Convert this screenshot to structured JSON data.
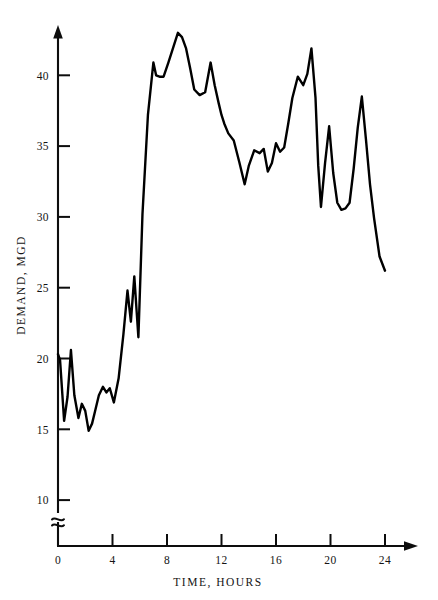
{
  "chart_data": {
    "type": "line",
    "title": "",
    "subtitle": "",
    "xlabel": "TIME, HOURS",
    "ylabel": "DEMAND, MGD",
    "xlim": [
      0,
      24
    ],
    "ylim": [
      10,
      44
    ],
    "y_axis_break": true,
    "y_axis_break_note": "axis broken between 0 and 10",
    "grid": false,
    "legend": null,
    "xticks": [
      0,
      4,
      8,
      12,
      16,
      20,
      24
    ],
    "xtick_labels": [
      "0",
      "4",
      "8",
      "12",
      "16",
      "20",
      "24"
    ],
    "yticks": [
      10,
      15,
      20,
      25,
      30,
      35,
      40
    ],
    "ytick_labels": [
      "10",
      "15",
      "20",
      "25",
      "30",
      "35",
      "40"
    ],
    "series": [
      {
        "name": "Hourly water demand",
        "x": [
          0.0,
          0.15,
          0.45,
          0.7,
          0.95,
          1.2,
          1.5,
          1.75,
          2.0,
          2.25,
          2.5,
          2.75,
          3.0,
          3.3,
          3.55,
          3.8,
          4.1,
          4.45,
          4.8,
          5.1,
          5.35,
          5.6,
          5.9,
          6.2,
          6.6,
          7.0,
          7.2,
          7.45,
          7.75,
          8.1,
          8.5,
          8.8,
          9.1,
          9.4,
          9.7,
          10.0,
          10.4,
          10.8,
          11.2,
          11.5,
          11.8,
          12.0,
          12.2,
          12.5,
          12.9,
          13.3,
          13.7,
          14.0,
          14.4,
          14.8,
          15.1,
          15.4,
          15.7,
          16.0,
          16.3,
          16.6,
          16.9,
          17.2,
          17.6,
          18.0,
          18.3,
          18.6,
          18.9,
          19.1,
          19.3,
          19.6,
          19.9,
          20.2,
          20.5,
          20.8,
          21.1,
          21.4,
          21.7,
          22.0,
          22.3,
          22.6,
          22.9,
          23.2,
          23.6,
          24.0
        ],
        "y": [
          20.3,
          19.9,
          15.6,
          17.3,
          20.6,
          17.4,
          15.8,
          16.8,
          16.3,
          14.9,
          15.4,
          16.4,
          17.4,
          18.0,
          17.6,
          17.9,
          16.9,
          18.6,
          21.7,
          24.8,
          22.6,
          25.8,
          21.5,
          30.2,
          37.2,
          40.9,
          40.0,
          39.9,
          39.9,
          40.9,
          42.1,
          43.0,
          42.7,
          41.9,
          40.5,
          39.0,
          38.6,
          38.8,
          40.9,
          39.3,
          38.0,
          37.2,
          36.6,
          35.9,
          35.4,
          33.9,
          32.3,
          33.6,
          34.7,
          34.5,
          34.8,
          33.2,
          33.8,
          35.2,
          34.6,
          34.9,
          36.6,
          38.4,
          39.9,
          39.3,
          40.1,
          41.9,
          38.4,
          33.6,
          30.7,
          33.8,
          36.4,
          33.1,
          31.0,
          30.5,
          30.6,
          31.0,
          33.4,
          36.3,
          38.5,
          35.5,
          32.3,
          29.9,
          27.2,
          26.2
        ]
      }
    ],
    "annotations": []
  },
  "axes": {
    "x_axis_name": "time-axis",
    "y_axis_name": "demand-axis",
    "x_arrow": true,
    "y_arrow": true
  }
}
